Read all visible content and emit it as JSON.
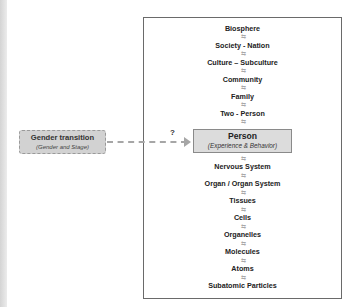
{
  "hierarchy": {
    "upper_levels": [
      {
        "label": "Biosphere"
      },
      {
        "label": "Society - Nation"
      },
      {
        "label": "Culture – Subculture"
      },
      {
        "label": "Community"
      },
      {
        "label": "Family"
      },
      {
        "label": "Two - Person"
      }
    ],
    "person": {
      "title": "Person",
      "subtitle": "(Experience & Behavior)"
    },
    "lower_levels": [
      {
        "label": "Nervous System"
      },
      {
        "label": "Organ / Organ System"
      },
      {
        "label": "Tissues"
      },
      {
        "label": "Cells"
      },
      {
        "label": "Organelles"
      },
      {
        "label": "Molecules"
      },
      {
        "label": "Atoms"
      },
      {
        "label": "Subatomic Particles"
      }
    ],
    "arrow_glyph": "⇆"
  },
  "gender_box": {
    "title": "Gender transition",
    "subtitle": "(Gender and Stage)"
  },
  "connector": {
    "label": "?"
  },
  "colors": {
    "person_fill": "#dcdcdc",
    "gender_fill": "#d2d2d2",
    "arrow": "#a9a9a9",
    "border": "#6a6a6a"
  }
}
